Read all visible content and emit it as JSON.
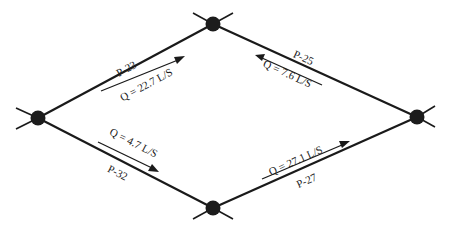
{
  "diagram": {
    "type": "pipe-network",
    "nodes": [
      {
        "id": "top",
        "x": 213,
        "y": 24
      },
      {
        "id": "left",
        "x": 38,
        "y": 118
      },
      {
        "id": "right",
        "x": 417,
        "y": 117
      },
      {
        "id": "bottom",
        "x": 213,
        "y": 208
      }
    ],
    "pipes": [
      {
        "id": "P-23",
        "label": "P-23",
        "from": "left",
        "to": "top",
        "flow": "Q = 22.7 L/S",
        "flow_direction": "left-to-top"
      },
      {
        "id": "P-25",
        "label": "P-25",
        "from": "right",
        "to": "top",
        "flow": "Q = 7.6 L/S",
        "flow_direction": "right-to-top"
      },
      {
        "id": "P-32",
        "label": "P-32",
        "from": "left",
        "to": "bottom",
        "flow": "Q = 4.7 L/S",
        "flow_direction": "left-to-bottom"
      },
      {
        "id": "P-27",
        "label": "P-27",
        "from": "bottom",
        "to": "right",
        "flow": "Q = 27.1 L/S",
        "flow_direction": "bottom-to-right"
      }
    ]
  }
}
